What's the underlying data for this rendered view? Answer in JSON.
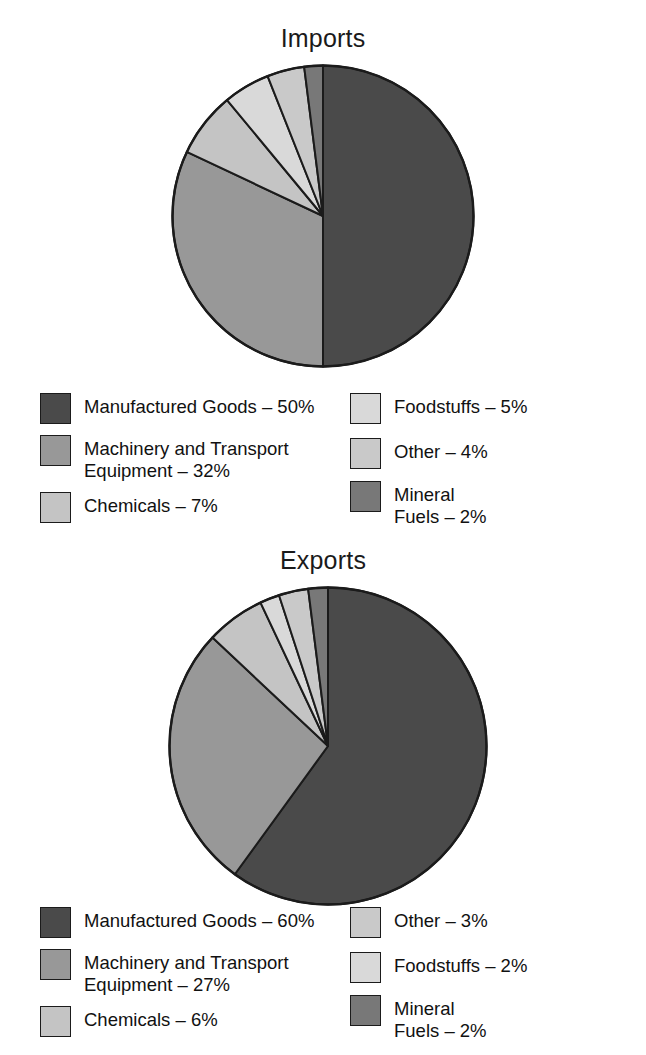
{
  "chart_data": [
    {
      "type": "pie",
      "title": "Imports",
      "categories": [
        "Manufactured Goods",
        "Machinery and Transport Equipment",
        "Chemicals",
        "Foodstuffs",
        "Other",
        "Mineral Fuels"
      ],
      "values": [
        50,
        32,
        7,
        5,
        4,
        2
      ],
      "unit": "%",
      "legend_position": "bottom",
      "legend_columns": 2,
      "slice_colors": [
        "#4a4a4a",
        "#989898",
        "#c4c4c4",
        "#d9d9d9",
        "#c9c9c9",
        "#787878"
      ],
      "slice_order_from_12_oclock_clockwise": [
        "Manufactured Goods",
        "Machinery and Transport Equipment",
        "Chemicals",
        "Foodstuffs",
        "Other",
        "Mineral Fuels"
      ],
      "legend_entries": [
        {
          "label": "Manufactured Goods – 50%",
          "color": "#4a4a4a",
          "column": "left"
        },
        {
          "label": "Machinery and Transport\nEquipment – 32%",
          "color": "#989898",
          "column": "left"
        },
        {
          "label": "Chemicals – 7%",
          "color": "#c4c4c4",
          "column": "left"
        },
        {
          "label": "Foodstuffs – 5%",
          "color": "#d9d9d9",
          "column": "right"
        },
        {
          "label": "Other – 4%",
          "color": "#c9c9c9",
          "column": "right"
        },
        {
          "label": "Mineral\nFuels – 2%",
          "color": "#787878",
          "column": "right"
        }
      ]
    },
    {
      "type": "pie",
      "title": "Exports",
      "categories": [
        "Manufactured Goods",
        "Machinery and Transport Equipment",
        "Chemicals",
        "Other",
        "Foodstuffs",
        "Mineral Fuels"
      ],
      "values": [
        60,
        27,
        6,
        3,
        2,
        2
      ],
      "unit": "%",
      "legend_position": "bottom",
      "legend_columns": 2,
      "slice_colors": [
        "#4a4a4a",
        "#989898",
        "#c4c4c4",
        "#c9c9c9",
        "#d9d9d9",
        "#787878"
      ],
      "slice_order_from_12_oclock_clockwise": [
        "Manufactured Goods",
        "Machinery and Transport Equipment",
        "Chemicals",
        "Foodstuffs",
        "Other",
        "Mineral Fuels"
      ],
      "legend_entries": [
        {
          "label": "Manufactured Goods – 60%",
          "color": "#4a4a4a",
          "column": "left"
        },
        {
          "label": "Machinery and Transport\nEquipment – 27%",
          "color": "#989898",
          "column": "left"
        },
        {
          "label": "Chemicals – 6%",
          "color": "#c4c4c4",
          "column": "left"
        },
        {
          "label": "Other – 3%",
          "color": "#c9c9c9",
          "column": "right"
        },
        {
          "label": "Foodstuffs – 2%",
          "color": "#d9d9d9",
          "column": "right"
        },
        {
          "label": "Mineral\nFuels – 2%",
          "color": "#787878",
          "column": "right"
        }
      ]
    }
  ],
  "imports": {
    "title": "Imports",
    "legend": {
      "left": [
        {
          "label": "Manufactured Goods – 50%"
        },
        {
          "label": "Machinery and Transport\nEquipment – 32%"
        },
        {
          "label": "Chemicals – 7%"
        }
      ],
      "right": [
        {
          "label": "Foodstuffs – 5%"
        },
        {
          "label": "Other – 4%"
        },
        {
          "label": "Mineral\nFuels – 2%"
        }
      ]
    }
  },
  "exports": {
    "title": "Exports",
    "legend": {
      "left": [
        {
          "label": "Manufactured Goods – 60%"
        },
        {
          "label": "Machinery and Transport\nEquipment – 27%"
        },
        {
          "label": "Chemicals – 6%"
        }
      ],
      "right": [
        {
          "label": "Other – 3%"
        },
        {
          "label": "Foodstuffs – 2%"
        },
        {
          "label": "Mineral\nFuels – 2%"
        }
      ]
    }
  },
  "style": {
    "stroke": "#1b1b1b",
    "background": "#ffffff"
  }
}
